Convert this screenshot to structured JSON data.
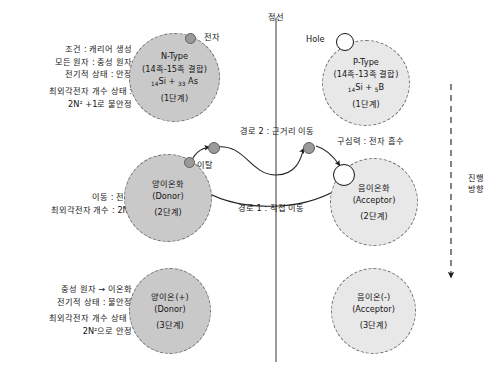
{
  "canvas": {
    "width": 496,
    "height": 377,
    "background": "#ffffff"
  },
  "colors": {
    "node_dark": "#c9c9c9",
    "node_light": "#e8e8e8",
    "node_border": "#6f6f6f",
    "electron_fill": "#9a9a9a",
    "hole_fill": "#ffffff",
    "line": "#2a2a2a",
    "text": "#141414"
  },
  "center_line": {
    "label": "정선"
  },
  "progress_axis": {
    "label_line1": "진행",
    "label_line2": "방향"
  },
  "carriers": {
    "electron_label": "전자",
    "hole_label": "Hole",
    "escape_label": "이탈"
  },
  "paths": {
    "path2_label": "경로 2 : 근거리 이동",
    "path1_label": "경로 1 : 직접 이동",
    "attraction_label": "구심력 : 전자 흡수"
  },
  "stages": [
    {
      "id": "stage1",
      "left_text": [
        "조건 : 캐리어 생성",
        "모든 원자 : 중성 원자",
        "전기적 상태 : 안정",
        "",
        "최외각전자 개수 상태 :",
        "2N² +1로 불안정"
      ],
      "left_node": {
        "title": "N-Type",
        "combination": "(14족-15족 결합)",
        "formula_pre": "14",
        "formula_mid": "Si +",
        "formula_sub2": "33",
        "formula_post": "As",
        "step": "(1단계)",
        "tone": "dark"
      },
      "right_node": {
        "title": "P-Type",
        "combination": "(14족-13족 결합)",
        "formula_pre": "14",
        "formula_mid": "Si +",
        "formula_sub2": "5",
        "formula_post": "B",
        "step": "(1단계)",
        "tone": "light"
      }
    },
    {
      "id": "stage2",
      "left_text": [
        "이동 : 전자",
        "최외각전자 개수 : 2N²"
      ],
      "left_node": {
        "title": "양이온화",
        "subtitle": "(Donor)",
        "step": "(2단계)",
        "tone": "dark"
      },
      "right_node": {
        "title": "음이온화",
        "subtitle": "(Acceptor)",
        "step": "(2단계)",
        "tone": "light"
      }
    },
    {
      "id": "stage3",
      "left_text": [
        "중성 원자 → 이온화",
        "전기적 상태 : 불안정",
        "",
        "최외각전자 개수 상태 :",
        "2N²으로 안정"
      ],
      "left_node": {
        "title": "양이온(+)",
        "subtitle": "(Donor)",
        "step": "(3단계)",
        "tone": "dark"
      },
      "right_node": {
        "title": "음이온(-)",
        "subtitle": "(Acceptor)",
        "step": "(3단계)",
        "tone": "light"
      }
    }
  ]
}
